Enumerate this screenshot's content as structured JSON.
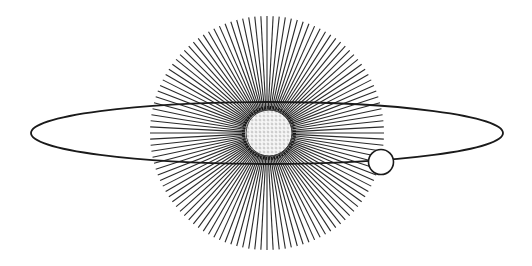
{
  "illustration": {
    "subject": "sun with radiating rays, elliptical orbit and orbiting planet",
    "colors": {
      "background": "#ffffff",
      "ink": "#1a1a1a",
      "ray": "#2a2a2a",
      "sun_fill": "#f4f4f4"
    },
    "rays": {
      "cx": 267,
      "cy": 133,
      "inner_r": 22,
      "outer_r": 117,
      "count": 120,
      "stroke_width": 1.1
    },
    "sun": {
      "cx": 269,
      "cy": 133,
      "r": 23
    },
    "orbit": {
      "cx": 267,
      "cy": 133,
      "rx": 236,
      "ry": 31,
      "stroke_width": 1.8
    },
    "planet": {
      "cx": 381,
      "cy": 162,
      "r": 12.5
    }
  }
}
